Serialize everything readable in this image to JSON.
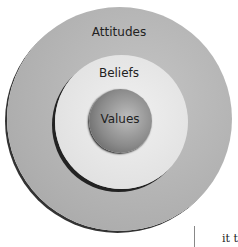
{
  "diagram": {
    "type": "concentric-circles",
    "layers": [
      {
        "label": "Attitudes",
        "position": "outer"
      },
      {
        "label": "Beliefs",
        "position": "middle"
      },
      {
        "label": "Values",
        "position": "inner"
      }
    ]
  },
  "page_fragment": {
    "text": "it t"
  }
}
